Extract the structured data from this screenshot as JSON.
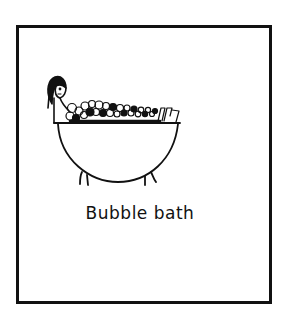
{
  "card": {
    "caption": "Bubble bath",
    "border_color": "#111111",
    "background": "#ffffff"
  },
  "illustration": {
    "subject": "person-in-bathtub-with-bubbles",
    "elements": [
      "person",
      "bathtub",
      "bubbles",
      "tub-legs"
    ]
  }
}
